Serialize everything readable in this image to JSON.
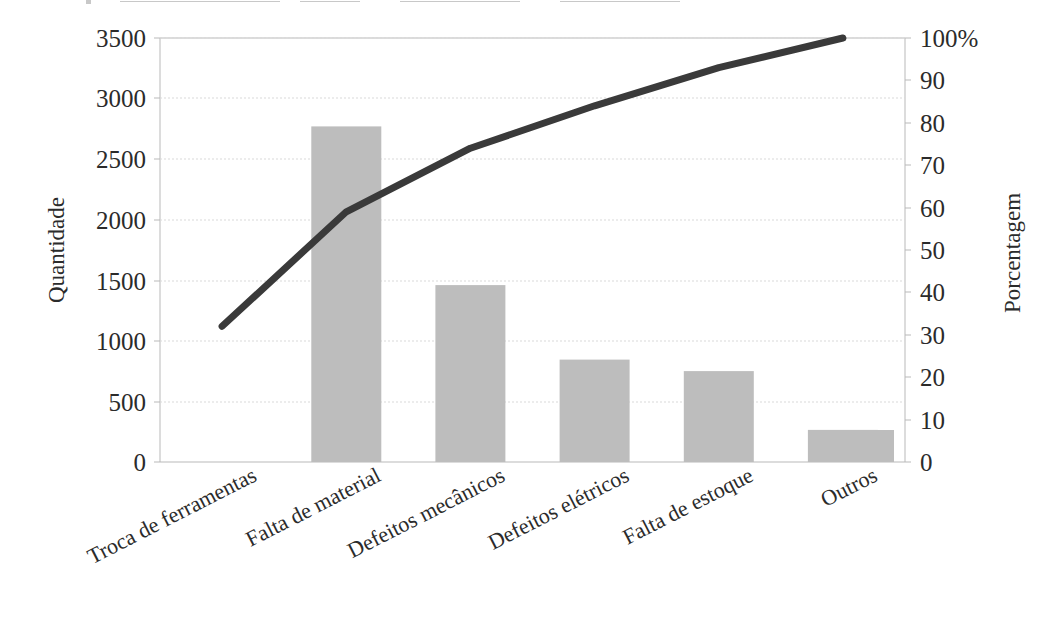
{
  "chart_data": {
    "type": "bar",
    "title": "",
    "subtitle": "",
    "xlabel": "",
    "ylabel": "Quantidade",
    "y2label": "Porcentagem",
    "categories": [
      "Troca de ferramentas",
      "Falta de material",
      "Defeitos mecânicos",
      "Defeitos elétricos",
      "Falta de estoque",
      "Outros"
    ],
    "values": [
      3020,
      2770,
      1460,
      845,
      750,
      265
    ],
    "cumulative_percent": [
      32,
      59,
      74,
      84,
      93,
      100
    ],
    "series": [
      {
        "name": "Quantidade",
        "type": "bar",
        "values": [
          3020,
          2770,
          1460,
          845,
          750,
          265
        ]
      },
      {
        "name": "Porcentagem",
        "type": "line",
        "values": [
          32,
          59,
          74,
          84,
          93,
          100
        ]
      }
    ],
    "ylim": [
      0,
      3500
    ],
    "y2lim": [
      0,
      100
    ],
    "yticks": [
      "0",
      "500",
      "1000",
      "1500",
      "2000",
      "2500",
      "3000",
      "3500"
    ],
    "y2ticks": [
      "0",
      "10",
      "20",
      "30",
      "40",
      "50",
      "60",
      "70",
      "80",
      "90",
      "100%"
    ],
    "grid": true,
    "legend": "none",
    "bar_color": "#bdbdbd",
    "line_color": "#3a3a3a",
    "grid_color": "#d9d9d9",
    "axis_color": "#b9b9b9",
    "label_rotation": -27
  }
}
